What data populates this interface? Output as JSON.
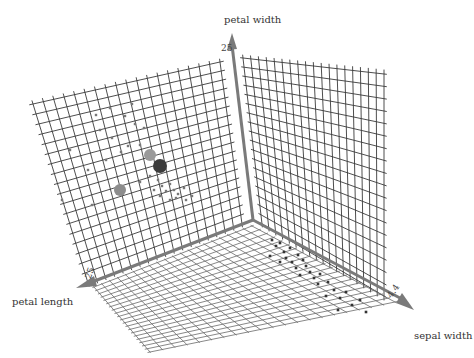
{
  "chart_data": {
    "type": "scatter",
    "dimensions": 3,
    "title": "",
    "axes": {
      "x": {
        "label": "sepal width",
        "tick_label": "4.4"
      },
      "y": {
        "label": "petal length",
        "tick_label": "25"
      },
      "z": {
        "label": "petal width",
        "tick_label": "25"
      }
    },
    "grid": true,
    "colors": {
      "grid": "#3a3a3a",
      "axis": "#7a7a7a",
      "point": "#555555",
      "marker_light": "#9a9a9a",
      "marker_dark": "#3c3c3c",
      "marker_mid": "#8c8c8c"
    },
    "highlighted_markers": [
      {
        "x": 150,
        "y": 155,
        "shade": "light"
      },
      {
        "x": 160,
        "y": 166,
        "shade": "dark"
      },
      {
        "x": 120,
        "y": 190,
        "shade": "mid"
      }
    ],
    "wall_points": [
      [
        96,
        115
      ],
      [
        110,
        108
      ],
      [
        132,
        104
      ],
      [
        125,
        116
      ],
      [
        135,
        124
      ],
      [
        100,
        130
      ],
      [
        112,
        138
      ],
      [
        128,
        146
      ],
      [
        121,
        152
      ],
      [
        106,
        160
      ],
      [
        140,
        145
      ],
      [
        144,
        128
      ],
      [
        88,
        170
      ],
      [
        70,
        150
      ],
      [
        62,
        200
      ],
      [
        92,
        205
      ],
      [
        150,
        176
      ],
      [
        158,
        180
      ],
      [
        162,
        186
      ],
      [
        170,
        184
      ],
      [
        166,
        191
      ],
      [
        174,
        190
      ],
      [
        178,
        194
      ],
      [
        184,
        188
      ],
      [
        176,
        198
      ],
      [
        186,
        200
      ],
      [
        170,
        200
      ],
      [
        192,
        196
      ],
      [
        154,
        190
      ],
      [
        160,
        196
      ],
      [
        140,
        182
      ]
    ],
    "floor_points": [
      [
        272,
        240
      ],
      [
        276,
        246
      ],
      [
        280,
        243
      ],
      [
        284,
        252
      ],
      [
        290,
        248
      ],
      [
        286,
        258
      ],
      [
        292,
        262
      ],
      [
        298,
        255
      ],
      [
        303,
        260
      ],
      [
        296,
        268
      ],
      [
        306,
        266
      ],
      [
        310,
        272
      ],
      [
        300,
        275
      ],
      [
        314,
        278
      ],
      [
        320,
        274
      ],
      [
        318,
        284
      ],
      [
        328,
        282
      ],
      [
        334,
        290
      ],
      [
        326,
        296
      ],
      [
        340,
        298
      ],
      [
        346,
        292
      ],
      [
        352,
        305
      ],
      [
        338,
        310
      ],
      [
        360,
        300
      ],
      [
        366,
        312
      ],
      [
        280,
        262
      ],
      [
        270,
        256
      ]
    ]
  }
}
